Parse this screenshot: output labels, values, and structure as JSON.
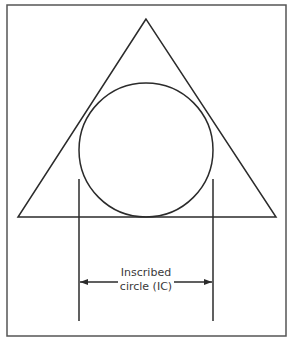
{
  "diagram": {
    "label_line1": "Inscribed",
    "label_line2": "circle (IC)",
    "colors": {
      "stroke": "#2b2b2b",
      "frame": "#555555",
      "text": "#3a3a3a",
      "background": "#ffffff"
    },
    "shapes": {
      "frame": {
        "x": 7,
        "y": 5,
        "width": 279,
        "height": 331
      },
      "triangle": {
        "apex": [
          146,
          19
        ],
        "base_left": [
          18,
          217
        ],
        "base_right": [
          276,
          217
        ]
      },
      "circle": {
        "cx": 146,
        "cy": 150,
        "r": 67
      },
      "extension_lines": [
        {
          "x": 79,
          "y1": 179,
          "y2": 321
        },
        {
          "x": 213,
          "y1": 179,
          "y2": 321
        }
      ],
      "dimension_arrow": {
        "y": 282,
        "x1": 79,
        "x2": 213
      }
    }
  }
}
